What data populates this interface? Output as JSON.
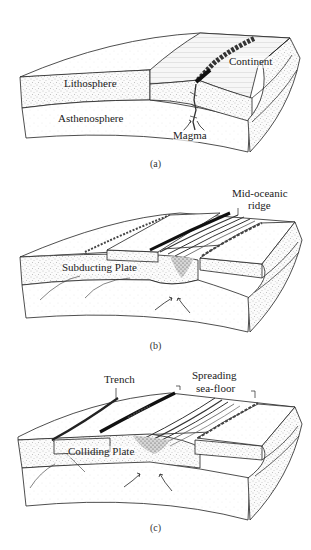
{
  "figure": {
    "panels": [
      {
        "id": "a",
        "caption": "(a)",
        "labels": {
          "lithosphere": "Lithosphere",
          "asthenosphere": "Asthenosphere",
          "continent": "Continent",
          "magma": "Magma"
        }
      },
      {
        "id": "b",
        "caption": "(b)",
        "labels": {
          "ridge_line1": "Mid-oceanic",
          "ridge_line2": "ridge",
          "subducting_plate": "Subducting Plate"
        }
      },
      {
        "id": "c",
        "caption": "(c)",
        "labels": {
          "trench": "Trench",
          "spreading_line1": "Spreading",
          "spreading_line2": "sea-floor",
          "colliding_plate": "Colliding Plate"
        }
      }
    ]
  },
  "colors": {
    "ink": "#222222",
    "stipple": "#9a9a9a",
    "surface": "#f4f4f4",
    "background": "#ffffff"
  }
}
